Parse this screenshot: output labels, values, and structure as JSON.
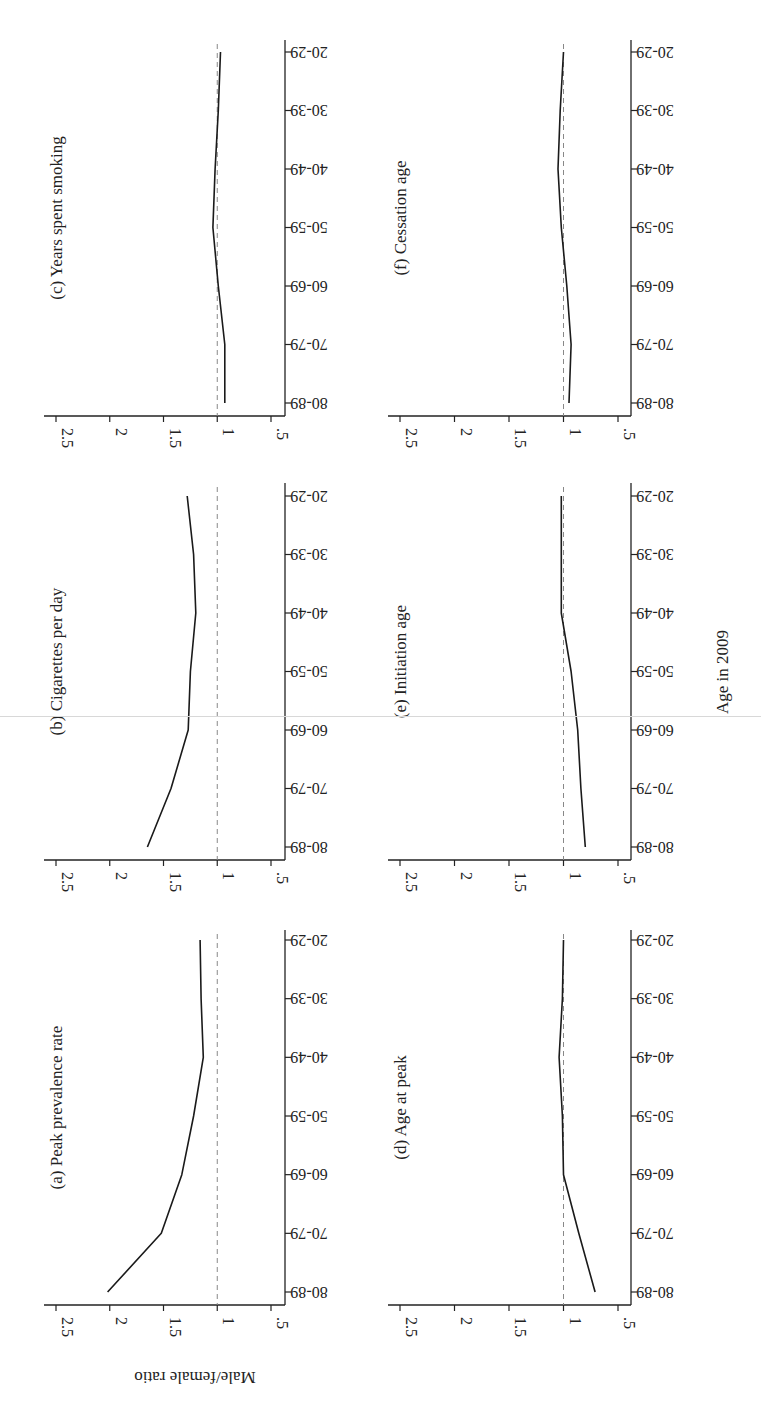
{
  "figure": {
    "orientation": "rotated-90-clockwise",
    "xlabel": "Age in 2009",
    "ylabel": "Male/female ratio",
    "line_color": "#1a1a1a",
    "reference_line_color": "#888888",
    "axis_color": "#222222"
  },
  "chart_data": [
    {
      "type": "line",
      "panel": "a",
      "title": "(a) Peak prevalence rate",
      "categories": [
        "80-89",
        "70-79",
        "60-69",
        "50-59",
        "40-49",
        "30-39",
        "20-29"
      ],
      "values": [
        2.02,
        1.52,
        1.33,
        1.22,
        1.13,
        1.15,
        1.16
      ],
      "xlabel": "Age in 2009",
      "ylabel": "Male/female ratio",
      "yticks": [
        ".5",
        "1",
        "1.5",
        "2",
        "2.5"
      ],
      "ylim": [
        0.4,
        2.6
      ],
      "reference_line": 1
    },
    {
      "type": "line",
      "panel": "b",
      "title": "(b) Cigarettes per day",
      "categories": [
        "80-89",
        "70-79",
        "60-69",
        "50-59",
        "40-49",
        "30-39",
        "20-29"
      ],
      "values": [
        1.65,
        1.43,
        1.27,
        1.25,
        1.2,
        1.22,
        1.28
      ],
      "xlabel": "Age in 2009",
      "ylabel": "Male/female ratio",
      "yticks": [
        ".5",
        "1",
        "1.5",
        "2",
        "2.5"
      ],
      "ylim": [
        0.4,
        2.6
      ],
      "reference_line": 1
    },
    {
      "type": "line",
      "panel": "c",
      "title": "(c) Years spent smoking",
      "categories": [
        "80-89",
        "70-79",
        "60-69",
        "50-59",
        "40-49",
        "30-39",
        "20-29"
      ],
      "values": [
        0.93,
        0.93,
        0.99,
        1.04,
        1.02,
        0.99,
        0.97
      ],
      "xlabel": "Age in 2009",
      "ylabel": "Male/female ratio",
      "yticks": [
        ".5",
        "1",
        "1.5",
        "2",
        "2.5"
      ],
      "ylim": [
        0.4,
        2.6
      ],
      "reference_line": 1
    },
    {
      "type": "line",
      "panel": "d",
      "title": "(d) Age at peak",
      "categories": [
        "80-89",
        "70-79",
        "60-69",
        "50-59",
        "40-49",
        "30-39",
        "20-29"
      ],
      "values": [
        0.71,
        0.86,
        1.0,
        1.01,
        1.04,
        1.01,
        1.0
      ],
      "xlabel": "Age in 2009",
      "ylabel": "Male/female ratio",
      "yticks": [
        ".5",
        "1",
        "1.5",
        "2",
        "2.5"
      ],
      "ylim": [
        0.4,
        2.6
      ],
      "reference_line": 1
    },
    {
      "type": "line",
      "panel": "e",
      "title": "(e) Initiation age",
      "categories": [
        "80-89",
        "70-79",
        "60-69",
        "50-59",
        "40-49",
        "30-39",
        "20-29"
      ],
      "values": [
        0.8,
        0.84,
        0.87,
        0.93,
        1.02,
        1.02,
        1.02
      ],
      "xlabel": "Age in 2009",
      "ylabel": "Male/female ratio",
      "yticks": [
        ".5",
        "1",
        "1.5",
        "2",
        "2.5"
      ],
      "ylim": [
        0.4,
        2.6
      ],
      "reference_line": 1
    },
    {
      "type": "line",
      "panel": "f",
      "title": "(f) Cessation age",
      "categories": [
        "80-89",
        "70-79",
        "60-69",
        "50-59",
        "40-49",
        "30-39",
        "20-29"
      ],
      "values": [
        0.95,
        0.93,
        0.97,
        1.02,
        1.05,
        1.03,
        1.0
      ],
      "xlabel": "Age in 2009",
      "ylabel": "Male/female ratio",
      "yticks": [
        ".5",
        "1",
        "1.5",
        "2",
        "2.5"
      ],
      "ylim": [
        0.4,
        2.6
      ],
      "reference_line": 1
    }
  ]
}
